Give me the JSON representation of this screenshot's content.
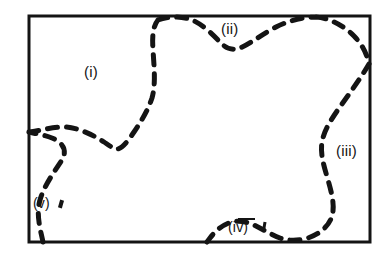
{
  "figure": {
    "background_color": "#ffffff",
    "ink_color": "#141414",
    "frame": {
      "name": "rectangular-border",
      "x": 29,
      "y": 16,
      "width": 341,
      "height": 226,
      "stroke_width": 3,
      "style": "solid"
    },
    "boundary_curve": {
      "name": "dashed-partition-curve",
      "style": "dashed",
      "stroke_width": 5,
      "dash_pattern": "10 9",
      "linecap": "round",
      "description": "A closed irregular dashed curve that repeatedly meets the rectangle border, dividing the interior into five regions",
      "path": "M 43 242 C 40 228, 36 214, 40 200 C 44 186, 54 172, 62 160 C 68 150, 62 142, 52 138 C 42 134, 31 133, 29 132 M 29 132 C 38 131, 48 128, 60 127 C 74 126, 90 133, 104 142 C 110 146, 114 149, 117 149 C 122 149, 128 141, 134 132 C 142 120, 148 110, 152 98 C 156 84, 154 66, 153 50 C 152 36, 153 26, 158 20 M 158 20 C 168 16, 182 16, 192 20 C 204 25, 214 36, 222 44 C 228 50, 234 50, 240 48 C 250 44, 262 34, 276 27 C 290 20, 304 17, 316 17 M 316 17 C 330 18, 344 26, 354 36 C 362 44, 367 54, 369 64 M 369 64 C 362 76, 352 90, 342 104 C 332 118, 324 130, 322 142 C 320 154, 324 166, 328 180 C 332 194, 335 206, 332 216 C 329 226, 320 234, 308 238 C 298 241, 288 241, 280 238 C 272 235, 264 230, 256 226 C 248 222, 240 220, 232 222 C 224 224, 216 230, 210 238 L 207 242"
    }
  },
  "labels": [
    {
      "id": "i",
      "text": "(i)",
      "x": 84,
      "y": 64,
      "region": "upper-left"
    },
    {
      "id": "ii",
      "text": "(ii)",
      "x": 221,
      "y": 21,
      "region": "top-center"
    },
    {
      "id": "iii",
      "text": "(iii)",
      "x": 336,
      "y": 143,
      "region": "right"
    },
    {
      "id": "iv",
      "text": "(iv)",
      "x": 228,
      "y": 220,
      "region": "bottom-center"
    },
    {
      "id": "v",
      "text": "(v)",
      "x": 33,
      "y": 196,
      "region": "lower-left"
    }
  ],
  "annotations": {
    "iv_has_overbar": "yes",
    "iv_tick_mark": "short pointer stroke right of (iv)",
    "v_tick_mark": "short pointer stroke right of (v)"
  }
}
